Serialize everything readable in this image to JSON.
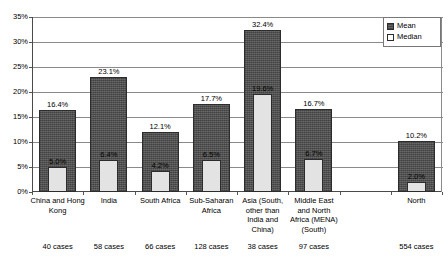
{
  "chart_data": {
    "type": "bar",
    "title": "",
    "subtitle": "",
    "xlabel": "",
    "ylabel": "",
    "ylim": [
      0,
      35
    ],
    "ytick_labels": [
      "0%",
      "5%",
      "10%",
      "15%",
      "20%",
      "25%",
      "30%",
      "35%"
    ],
    "ytick_values": [
      0,
      5,
      10,
      15,
      20,
      25,
      30,
      35
    ],
    "grid": true,
    "legend_position": "top-right",
    "categories": [
      "China and Hong Kong",
      "India",
      "South Africa",
      "Sub-Saharan Africa",
      "Asia (South, other than India and China)",
      "Middle East and North Africa (MENA) (South)",
      "",
      "North"
    ],
    "category_lines": [
      [
        "China and Hong",
        "Kong"
      ],
      [
        "India"
      ],
      [
        "South Africa"
      ],
      [
        "Sub-Saharan",
        "Africa"
      ],
      [
        "Asia (South,",
        "other than",
        "India and",
        "China)"
      ],
      [
        "Middle East",
        "and North",
        "Africa (MENA)",
        "(South)"
      ],
      [
        ""
      ],
      [
        "North"
      ]
    ],
    "case_counts": [
      "40 cases",
      "58 cases",
      "66 cases",
      "128 cases",
      "38 cases",
      "97 cases",
      "",
      "554 cases"
    ],
    "series": [
      {
        "name": "Mean",
        "color": "#5a5a5a",
        "values": [
          16.4,
          23.1,
          12.1,
          17.7,
          32.4,
          16.7,
          null,
          10.2
        ],
        "labels": [
          "16.4%",
          "23.1%",
          "12.1%",
          "17.7%",
          "32.4%",
          "16.7%",
          "",
          "10.2%"
        ]
      },
      {
        "name": "Median",
        "color": "#e3e3e3",
        "values": [
          5.0,
          6.4,
          4.2,
          6.5,
          19.6,
          6.7,
          null,
          2.0
        ],
        "labels": [
          "5.0%",
          "6.4%",
          "4.2%",
          "6.5%",
          "19.6%",
          "6.7%",
          "",
          "2.0%"
        ]
      }
    ]
  },
  "legend": {
    "items": [
      {
        "label": "Mean",
        "swatch": "mean"
      },
      {
        "label": "Median",
        "swatch": "median"
      }
    ]
  }
}
